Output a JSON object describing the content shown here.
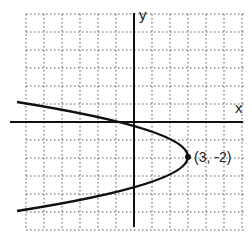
{
  "chart_data": {
    "type": "line",
    "title": "",
    "xlabel": "x",
    "ylabel": "y",
    "grid": true,
    "grid_style": "dotted",
    "xlim": [
      -7,
      6
    ],
    "ylim": [
      -6,
      6
    ],
    "curve": "sideways parabola opening left",
    "vertex": {
      "x": 3,
      "y": -2
    },
    "annotations": [
      {
        "text": "(3, -2)",
        "x": 3,
        "y": -2
      }
    ],
    "series": [
      {
        "name": "parabola",
        "points": [
          {
            "x": -6.5,
            "y": 1.1
          },
          {
            "x": 0,
            "y": 0
          },
          {
            "x": 3,
            "y": -2
          },
          {
            "x": 0,
            "y": -4
          },
          {
            "x": -6.5,
            "y": -5.0
          }
        ]
      }
    ]
  },
  "labels": {
    "x_axis": "x",
    "y_axis": "y",
    "vertex": "(3, -2)"
  }
}
